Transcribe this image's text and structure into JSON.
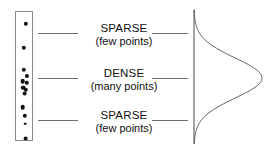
{
  "figure": {
    "background_color": "#ffffff",
    "width": 272,
    "height": 148
  },
  "dot_column": {
    "name": "point-scatter-column",
    "border_color": "#8a8a8a",
    "dot_color": "#111111",
    "box": {
      "x": 15,
      "y": 11,
      "width": 18,
      "height": 130
    },
    "dot_count": 13,
    "dots": [
      {
        "cx": 9.5,
        "cy": 12.0,
        "r": 2.2
      },
      {
        "cx": 8.0,
        "cy": 36.0,
        "r": 2.2
      },
      {
        "cx": 7.5,
        "cy": 58.0,
        "r": 2.2
      },
      {
        "cx": 10.5,
        "cy": 63.5,
        "r": 2.1
      },
      {
        "cx": 6.5,
        "cy": 69.0,
        "r": 2.3
      },
      {
        "cx": 10.5,
        "cy": 70.5,
        "r": 2.2
      },
      {
        "cx": 7.0,
        "cy": 75.5,
        "r": 2.3
      },
      {
        "cx": 10.0,
        "cy": 77.5,
        "r": 2.2
      },
      {
        "cx": 8.5,
        "cy": 81.5,
        "r": 2.4
      },
      {
        "cx": 6.5,
        "cy": 95.0,
        "r": 2.3
      },
      {
        "cx": 9.0,
        "cy": 104.0,
        "r": 2.2
      },
      {
        "cx": 9.5,
        "cy": 126.5,
        "r": 2.4
      },
      {
        "cx": 9.0,
        "cy": 111.5,
        "r": 1.3
      }
    ]
  },
  "annotations": [
    {
      "id": "sparse-top",
      "title": "SPARSE",
      "subtitle": "(few points)",
      "density": "sparse",
      "label_x": 78,
      "label_y": 22,
      "left_line": {
        "x": 38,
        "y": 33,
        "width": 40
      },
      "right_line": {
        "x": 152,
        "y": 33,
        "width": 36
      }
    },
    {
      "id": "dense-middle",
      "title": "DENSE",
      "subtitle": "(many points)",
      "density": "dense",
      "label_x": 78,
      "label_y": 67,
      "left_line": {
        "x": 38,
        "y": 78,
        "width": 40
      },
      "right_line": {
        "x": 152,
        "y": 78,
        "width": 36
      }
    },
    {
      "id": "sparse-bottom",
      "title": "SPARSE",
      "subtitle": "(few points)",
      "density": "sparse",
      "label_x": 78,
      "label_y": 109,
      "left_line": {
        "x": 38,
        "y": 120,
        "width": 40
      },
      "right_line": {
        "x": 152,
        "y": 120,
        "width": 36
      }
    }
  ],
  "line_style": {
    "color": "#6f6f6f",
    "thickness_px": 1.4
  },
  "chart_data": {
    "type": "line",
    "subtitle": "",
    "xlabel": "",
    "ylabel": "",
    "orientation": "vertical-axis-horizontal-density",
    "grid": false,
    "legend": null,
    "axis": {
      "draw_vertical_axis": true,
      "axis_x_px": 6,
      "axis_top_px": 6,
      "axis_bottom_px": 140,
      "color": "#4a4a4a"
    },
    "curve": {
      "color": "#5a5a5a",
      "stroke_width": 1.0,
      "distribution": "gaussian",
      "mean_y_px": 74,
      "sigma_y_px": 20,
      "peak_amplitude_px": 68,
      "baseline_x_px": 6
    },
    "x": [
      6,
      10,
      14,
      18,
      22,
      26,
      30,
      34,
      38,
      42,
      46,
      50,
      54,
      58,
      62,
      66,
      70,
      74,
      78,
      82,
      86,
      90,
      94,
      98,
      102,
      106,
      110,
      114,
      118,
      122,
      126,
      130,
      134,
      138,
      142
    ],
    "series": [
      {
        "name": "density",
        "values": [
          0.0,
          0.0,
          0.1,
          0.2,
          0.4,
          0.8,
          1.6,
          3.0,
          5.4,
          9.2,
          15.0,
          23.2,
          34.0,
          46.6,
          58.8,
          67.0,
          68.0,
          68.0,
          65.0,
          56.8,
          45.0,
          32.6,
          21.8,
          13.4,
          7.6,
          4.0,
          2.0,
          1.0,
          0.5,
          0.2,
          0.1,
          0.0,
          0.0,
          0.0,
          0.0
        ]
      }
    ],
    "xlim": [
      6,
      142
    ],
    "ylim": [
      0,
      70
    ],
    "annotations_linked": [
      "sparse-top",
      "dense-middle",
      "sparse-bottom"
    ]
  }
}
